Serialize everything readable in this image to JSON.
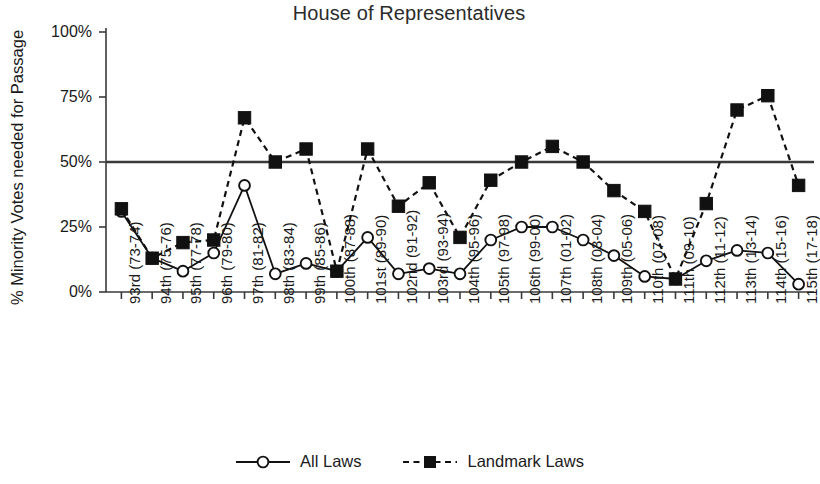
{
  "chart_data": {
    "type": "line",
    "title": "House of Representatives",
    "xlabel": "",
    "ylabel": "% Minority Votes needed for Passage",
    "ylim": [
      0,
      100
    ],
    "ytick_labels": [
      "0%",
      "25%",
      "50%",
      "75%",
      "100%"
    ],
    "ytick_values": [
      0,
      25,
      50,
      75,
      100
    ],
    "grid": false,
    "legend_position": "bottom-center",
    "reference_line": {
      "value": 50,
      "label": ""
    },
    "categories": [
      "93rd (73-74)",
      "94th (75-76)",
      "95th (77-78)",
      "96th (79-80)",
      "97th (81-82)",
      "98th (83-84)",
      "99th (85-86)",
      "100th (87-88)",
      "101st (89-90)",
      "102nd (91-92)",
      "103rd (93-94)",
      "104th (95-96)",
      "105th (97-98)",
      "106th (99-00)",
      "107th (01-02)",
      "108th (03-04)",
      "109th (05-06)",
      "110th (07-08)",
      "111th (09-10)",
      "112th (11-12)",
      "113th (13-14)",
      "114th (15-16)",
      "115th (17-18)"
    ],
    "series": [
      {
        "name": "All Laws",
        "style": "solid",
        "marker": "open-circle",
        "color": "#111111",
        "values": [
          31,
          13,
          8,
          15,
          41,
          7,
          11,
          8,
          21,
          7,
          9,
          7,
          20,
          25,
          25,
          20,
          14,
          6,
          5,
          12,
          16,
          15,
          3
        ]
      },
      {
        "name": "Landmark Laws",
        "style": "dashed",
        "marker": "filled-square",
        "color": "#111111",
        "values": [
          32,
          13,
          19,
          20,
          67,
          50,
          55,
          8,
          55,
          33,
          42,
          21,
          43,
          50,
          56,
          50,
          39,
          31,
          5,
          34,
          70,
          75.5,
          41
        ]
      }
    ]
  },
  "legend": {
    "entries": [
      {
        "label": "All Laws",
        "marker": "open-circle",
        "line": "solid"
      },
      {
        "label": "Landmark Laws",
        "marker": "filled-square",
        "line": "dashed"
      }
    ]
  }
}
